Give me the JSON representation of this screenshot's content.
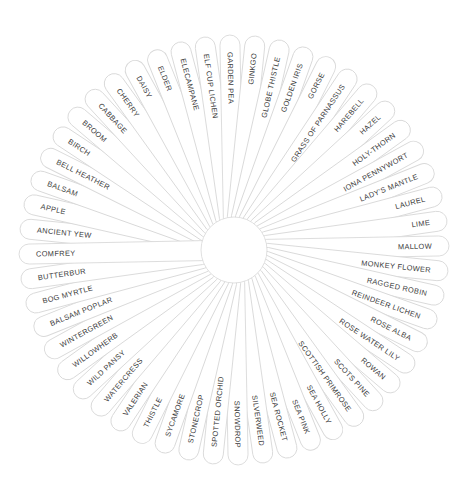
{
  "figure": {
    "kind": "radial-word-wheel",
    "center_x": 234,
    "center_y": 250,
    "hub_radius": 33,
    "outer_radius": 205,
    "petal_thickness": 20,
    "petal_count": 52,
    "start_angle_deg": -174.2,
    "angle_step_deg": 6.923,
    "colors": {
      "background": "#ffffff",
      "petal_fill": "#ffffff",
      "petal_stroke": "#d9d9d9",
      "hub_fill": "#ffffff",
      "hub_stroke": "#dcdcdc",
      "label_text": "#3b3b3b"
    }
  },
  "petals": [
    {
      "label": "ANCIENT YEW"
    },
    {
      "label": "APPLE"
    },
    {
      "label": "BALSAM"
    },
    {
      "label": "BELL HEATHER"
    },
    {
      "label": "BIRCH"
    },
    {
      "label": "BROOM"
    },
    {
      "label": "CABBAGE"
    },
    {
      "label": "CHERRY"
    },
    {
      "label": "DAISY"
    },
    {
      "label": "ELDER"
    },
    {
      "label": "ELECAMPANE"
    },
    {
      "label": "ELF CUP LICHEN"
    },
    {
      "label": "GARDEN PEA"
    },
    {
      "label": "GINKGO"
    },
    {
      "label": "GLOBE THISTLE"
    },
    {
      "label": "GOLDEN IRIS"
    },
    {
      "label": "GORSE"
    },
    {
      "label": "GRASS OF PARNASSUS"
    },
    {
      "label": "HAREBELL"
    },
    {
      "label": "HAZEL"
    },
    {
      "label": "HOLY-THORN"
    },
    {
      "label": "IONA PENNYWORT"
    },
    {
      "label": "LADY'S MANTLE"
    },
    {
      "label": "LAUREL"
    },
    {
      "label": "LIME"
    },
    {
      "label": "MALLOW"
    },
    {
      "label": "MONKEY FLOWER"
    },
    {
      "label": "RAGGED ROBIN"
    },
    {
      "label": "REINDEER LICHEN"
    },
    {
      "label": "ROSE ALBA"
    },
    {
      "label": "ROSE WATER LILY"
    },
    {
      "label": "ROWAN"
    },
    {
      "label": "SCOTS PINE"
    },
    {
      "label": "SCOTTISH PRIMROSE"
    },
    {
      "label": "SEA HOLLY"
    },
    {
      "label": "SEA PINK"
    },
    {
      "label": "SEA ROCKET"
    },
    {
      "label": "SILVERWEED"
    },
    {
      "label": "SNOWDROP"
    },
    {
      "label": "SPOTTED ORCHID"
    },
    {
      "label": "STONECROP"
    },
    {
      "label": "SYCAMORE"
    },
    {
      "label": "THISTLE"
    },
    {
      "label": "VALERIAN"
    },
    {
      "label": "WATERCRESS"
    },
    {
      "label": "WILD PANSY"
    },
    {
      "label": "WILLOWHERB"
    },
    {
      "label": "WINTERGREEN"
    },
    {
      "label": "BALSAM POPLAR"
    },
    {
      "label": "BOG MYRTLE"
    },
    {
      "label": "BUTTERBUR"
    },
    {
      "label": "COMFREY"
    }
  ]
}
